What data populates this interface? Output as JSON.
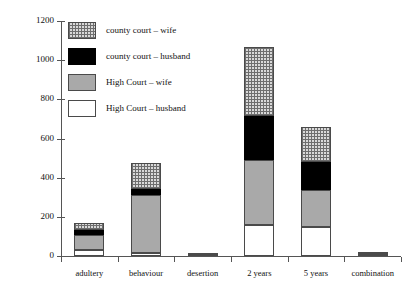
{
  "chart_data": {
    "type": "bar",
    "title": "",
    "xlabel": "",
    "ylabel": "",
    "ylim": [
      0,
      1200
    ],
    "yticks": [
      0,
      200,
      400,
      600,
      800,
      1000,
      1200
    ],
    "grid": false,
    "stacked": true,
    "legend_position": "upper-left-inside",
    "categories": [
      "adultery",
      "behaviour",
      "desertion",
      "2 years",
      "5 years",
      "combination"
    ],
    "series": [
      {
        "name": "High Court – husband",
        "swatch": "white",
        "color": "#ffffff",
        "values": [
          30,
          15,
          4,
          160,
          150,
          8
        ]
      },
      {
        "name": "High Court – wife",
        "swatch": "grey",
        "color": "#a9a9a9",
        "values": [
          75,
          295,
          6,
          330,
          185,
          12
        ]
      },
      {
        "name": "county court – husband",
        "swatch": "black",
        "color": "#000000",
        "values": [
          30,
          30,
          0,
          225,
          145,
          0
        ]
      },
      {
        "name": "county court – wife",
        "swatch": "crosshatch",
        "color": "#d9d9d9",
        "values": [
          35,
          135,
          0,
          350,
          180,
          0
        ]
      }
    ],
    "totals": [
      170,
      475,
      10,
      1065,
      660,
      20
    ]
  },
  "legend": {
    "items": [
      {
        "label": "county court – wife",
        "swatch": "crosshatch"
      },
      {
        "label": "county court – husband",
        "swatch": "black"
      },
      {
        "label": "High Court – wife",
        "swatch": "grey"
      },
      {
        "label": "High Court – husband",
        "swatch": "white"
      }
    ]
  },
  "axis": {
    "y_tick_labels": [
      "1200",
      "1000",
      "800",
      "600",
      "400",
      "200",
      "0"
    ],
    "x_tick_labels": [
      "adultery",
      "behaviour",
      "desertion",
      "2 years",
      "5 years",
      "combination"
    ]
  }
}
